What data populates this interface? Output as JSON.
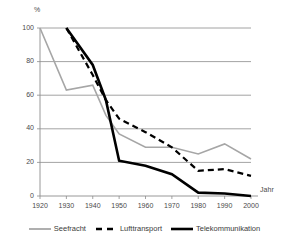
{
  "chart_data": {
    "type": "line",
    "title": "",
    "subtitle": "",
    "xlabel": "Jahr",
    "ylabel": "%",
    "xlim": [
      1920,
      2000
    ],
    "ylim": [
      0,
      100
    ],
    "x_ticks": [
      1920,
      1930,
      1940,
      1950,
      1960,
      1970,
      1980,
      1990,
      2000
    ],
    "y_ticks": [
      0,
      20,
      40,
      60,
      80,
      100
    ],
    "grid": "horizontal",
    "legend_position": "bottom",
    "series": [
      {
        "name": "Seefracht",
        "style": "solid",
        "color": "#a6a6a6",
        "width": 1.6,
        "x": [
          1920,
          1930,
          1940,
          1945,
          1950,
          1960,
          1970,
          1980,
          1990,
          2000
        ],
        "values": [
          100,
          63,
          66,
          48,
          37,
          29,
          29,
          25,
          31,
          22
        ]
      },
      {
        "name": "Lufttransport",
        "style": "dashed",
        "color": "#000000",
        "width": 2.2,
        "x": [
          1930,
          1940,
          1945,
          1950,
          1960,
          1970,
          1980,
          1990,
          2000
        ],
        "values": [
          100,
          72,
          57,
          46,
          38,
          29,
          15,
          16,
          12
        ]
      },
      {
        "name": "Telekommunikation",
        "style": "solid",
        "color": "#000000",
        "width": 2.6,
        "x": [
          1930,
          1940,
          1945,
          1950,
          1960,
          1970,
          1980,
          1990,
          2000
        ],
        "values": [
          100,
          78,
          57,
          21,
          18,
          13,
          2,
          1.5,
          0
        ]
      }
    ]
  },
  "axis": {
    "unit_label": "%",
    "x_axis_label": "Jahr",
    "y_tick_labels": [
      "0",
      "20",
      "40",
      "60",
      "80",
      "100"
    ],
    "x_tick_labels": [
      "1920",
      "1930",
      "1940",
      "1950",
      "1960",
      "1970",
      "1980",
      "1990",
      "2000"
    ]
  },
  "legend": {
    "items": [
      {
        "label": "Seefracht"
      },
      {
        "label": "Lufttransport"
      },
      {
        "label": "Telekommunikation"
      }
    ]
  },
  "colors": {
    "seefracht": "#a6a6a6",
    "lufttransport": "#000000",
    "telekommunikation": "#000000",
    "grid": "#8c8c8c",
    "axis": "#8c8c8c",
    "text": "#4a4a4a",
    "background": "#ffffff"
  }
}
